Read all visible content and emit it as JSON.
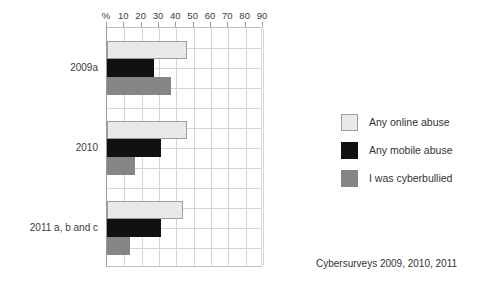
{
  "chart_data": {
    "type": "bar",
    "orientation": "horizontal",
    "title": "",
    "subtitle": "",
    "xlabel": "%",
    "ylabel": "",
    "xlim": [
      0,
      90
    ],
    "xticks": [
      0,
      10,
      20,
      30,
      40,
      50,
      60,
      70,
      80,
      90
    ],
    "xtick_labels": [
      "%",
      "10",
      "20",
      "30",
      "40",
      "50",
      "60",
      "70",
      "80",
      "90"
    ],
    "grid": true,
    "legend_position": "right",
    "categories": [
      "2009a",
      "2010",
      "2011 a, b and c"
    ],
    "series": [
      {
        "name": "Any online abuse",
        "color": "#e9e9e9",
        "values": [
          46,
          46,
          44
        ]
      },
      {
        "name": "Any mobile abuse",
        "color": "#111111",
        "values": [
          27,
          31,
          31
        ]
      },
      {
        "name": "I was cyberbullied",
        "color": "#858585",
        "values": [
          37,
          16,
          13
        ]
      }
    ],
    "annotations": [
      "Cybersurveys 2009, 2010, 2011"
    ]
  },
  "legend": {
    "items": [
      {
        "label": "Any online abuse"
      },
      {
        "label": "Any mobile abuse"
      },
      {
        "label": "I was cyberbullied"
      }
    ]
  },
  "footer": {
    "source": "Cybersurveys 2009, 2010, 2011"
  }
}
